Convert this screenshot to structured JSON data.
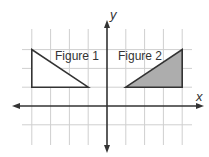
{
  "diagram": {
    "type": "coordinate-plane",
    "axes": {
      "x_label": "x",
      "y_label": "y",
      "x_grid_range": [
        -4,
        4
      ],
      "y_grid_range": [
        -1,
        3
      ]
    },
    "figures": [
      {
        "name": "Figure 1",
        "label": "Figure 1",
        "vertices": [
          [
            -4,
            3
          ],
          [
            -4,
            1
          ],
          [
            -1,
            1
          ]
        ],
        "fill": "#ffffff",
        "stroke": "#333333"
      },
      {
        "name": "Figure 2",
        "label": "Figure 2",
        "vertices": [
          [
            1,
            1
          ],
          [
            4,
            3
          ],
          [
            4,
            1
          ]
        ],
        "fill": "#adadad",
        "stroke": "#333333"
      }
    ]
  }
}
